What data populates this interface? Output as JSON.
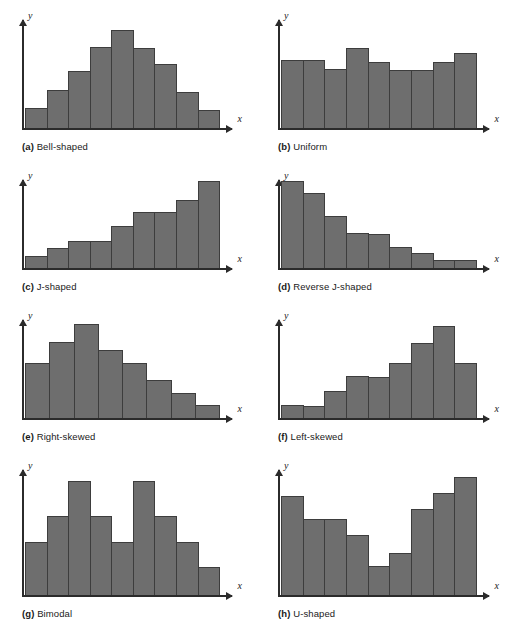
{
  "figure": {
    "bar_color": "#6e6e6e",
    "bar_border_color": "#3d3d3d",
    "axis_color": "#2b2b2b",
    "background": "#ffffff"
  },
  "chart_data": [
    {
      "type": "bar",
      "panel": "a",
      "tag": "(a)",
      "title": "Bell-shaped",
      "xlabel": "x",
      "ylabel": "y",
      "grid": false,
      "legend": "none",
      "categories": [
        "1",
        "2",
        "3",
        "4",
        "5",
        "6",
        "7",
        "8",
        "9"
      ],
      "values": [
        18,
        35,
        52,
        74,
        89,
        73,
        58,
        33,
        16
      ],
      "ylim": [
        0,
        100
      ]
    },
    {
      "type": "bar",
      "panel": "b",
      "tag": "(b)",
      "title": "Uniform",
      "xlabel": "x",
      "ylabel": "y",
      "grid": false,
      "legend": "none",
      "categories": [
        "1",
        "2",
        "3",
        "4",
        "5",
        "6",
        "7",
        "8",
        "9"
      ],
      "values": [
        62,
        62,
        54,
        73,
        60,
        53,
        53,
        60,
        68
      ],
      "ylim": [
        0,
        100
      ]
    },
    {
      "type": "bar",
      "panel": "c",
      "tag": "(c)",
      "title": "J-shaped",
      "xlabel": "x",
      "ylabel": "y",
      "grid": false,
      "legend": "none",
      "categories": [
        "1",
        "2",
        "3",
        "4",
        "5",
        "6",
        "7",
        "8",
        "9"
      ],
      "values": [
        13,
        22,
        30,
        30,
        47,
        62,
        62,
        76,
        97
      ],
      "ylim": [
        0,
        100
      ]
    },
    {
      "type": "bar",
      "panel": "d",
      "tag": "(d)",
      "title": "Reverse J-shaped",
      "xlabel": "x",
      "ylabel": "y",
      "grid": false,
      "legend": "none",
      "categories": [
        "1",
        "2",
        "3",
        "4",
        "5",
        "6",
        "7",
        "8",
        "9"
      ],
      "values": [
        97,
        83,
        58,
        39,
        38,
        23,
        17,
        9,
        9
      ],
      "ylim": [
        0,
        100
      ]
    },
    {
      "type": "bar",
      "panel": "e",
      "tag": "(e)",
      "title": "Right-skewed",
      "xlabel": "x",
      "ylabel": "y",
      "grid": false,
      "legend": "none",
      "categories": [
        "1",
        "2",
        "3",
        "4",
        "5",
        "6",
        "7",
        "8"
      ],
      "values": [
        55,
        76,
        94,
        68,
        55,
        38,
        25,
        13
      ],
      "ylim": [
        0,
        100
      ]
    },
    {
      "type": "bar",
      "panel": "f",
      "tag": "(f)",
      "title": "Left-skewed",
      "xlabel": "x",
      "ylabel": "y",
      "grid": false,
      "legend": "none",
      "categories": [
        "1",
        "2",
        "3",
        "4",
        "5",
        "6",
        "7",
        "8",
        "9"
      ],
      "values": [
        13,
        12,
        27,
        42,
        41,
        55,
        75,
        92,
        55
      ],
      "ylim": [
        0,
        100
      ]
    },
    {
      "type": "bar",
      "panel": "g",
      "tag": "(g)",
      "title": "Bimodal",
      "xlabel": "x",
      "ylabel": "y",
      "grid": false,
      "legend": "none",
      "categories": [
        "1",
        "2",
        "3",
        "4",
        "5",
        "6",
        "7",
        "8",
        "9"
      ],
      "values": [
        42,
        62,
        90,
        62,
        42,
        90,
        62,
        42,
        22
      ],
      "ylim": [
        0,
        100
      ]
    },
    {
      "type": "bar",
      "panel": "h",
      "tag": "(h)",
      "title": "U-shaped",
      "xlabel": "x",
      "ylabel": "y",
      "grid": false,
      "legend": "none",
      "categories": [
        "1",
        "2",
        "3",
        "4",
        "5",
        "6",
        "7",
        "8",
        "9"
      ],
      "values": [
        78,
        60,
        60,
        47,
        23,
        33,
        68,
        80,
        93
      ],
      "ylim": [
        0,
        100
      ]
    }
  ]
}
